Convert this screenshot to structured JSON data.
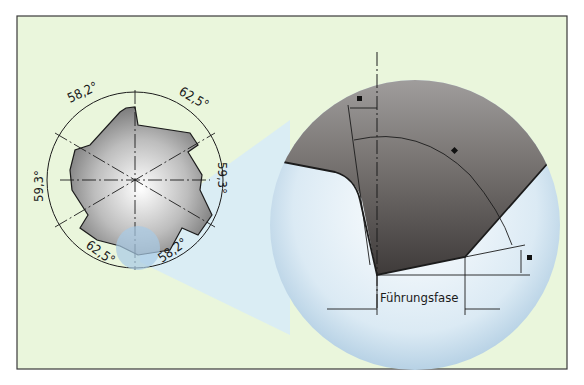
{
  "figure": {
    "background_color": "#eaf6dc",
    "frame_color": "#3a3a3a",
    "callout_color": "#d4e9f5",
    "tool_color_dark": "#5e5a58",
    "tool_color_light": "#d8d8d8"
  },
  "cross_section": {
    "angles": [
      {
        "id": "top-left",
        "label": "58,2°"
      },
      {
        "id": "top-right",
        "label": "62,5°"
      },
      {
        "id": "left",
        "label": "59,3°"
      },
      {
        "id": "right",
        "label": "59,3°"
      },
      {
        "id": "bottom-left",
        "label": "62,5°"
      },
      {
        "id": "bottom-right",
        "label": "58,2°"
      }
    ]
  },
  "detail_view": {
    "margin_label": "Führungsfase",
    "marker_symbol": "■"
  }
}
